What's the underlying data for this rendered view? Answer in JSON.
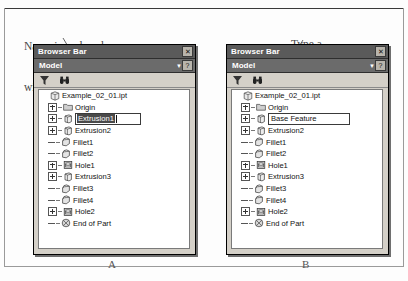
{
  "figure": {
    "labels": {
      "left": "A",
      "right": "B"
    },
    "annotations": {
      "left_line1": "Name is replaced",
      "left_line2": "with a text box",
      "right_line1": "Type a",
      "right_line2": "new name"
    }
  },
  "panel_left": {
    "titlebar": {
      "title": "Browser Bar",
      "close_label": "✕"
    },
    "modelbar": {
      "label": "Model",
      "caret": "▼",
      "help_label": "?"
    },
    "toolbar": {
      "filter_icon": "funnel-icon",
      "find_icon": "binoculars-icon"
    },
    "tree": {
      "root": {
        "label": "Example_02_01.ipt",
        "icon": "part-document-icon"
      },
      "items": [
        {
          "label": "Origin",
          "icon": "folder-icon",
          "expander": "plus"
        },
        {
          "label": "Extrusion1",
          "icon": "extrusion-icon",
          "expander": "plus",
          "editing": true,
          "selected": true
        },
        {
          "label": "Extrusion2",
          "icon": "extrusion-icon",
          "expander": "plus"
        },
        {
          "label": "Fillet1",
          "icon": "fillet-icon",
          "expander": "dash"
        },
        {
          "label": "Fillet2",
          "icon": "fillet-icon",
          "expander": "dash"
        },
        {
          "label": "Hole1",
          "icon": "hole-icon",
          "expander": "plus"
        },
        {
          "label": "Extrusion3",
          "icon": "extrusion-icon",
          "expander": "plus"
        },
        {
          "label": "Fillet3",
          "icon": "fillet-icon",
          "expander": "dash"
        },
        {
          "label": "Fillet4",
          "icon": "fillet-icon",
          "expander": "dash"
        },
        {
          "label": "Hole2",
          "icon": "hole-icon",
          "expander": "plus"
        },
        {
          "label": "End of Part",
          "icon": "end-of-part-icon",
          "expander": "dash"
        }
      ]
    }
  },
  "panel_right": {
    "titlebar": {
      "title": "Browser Bar",
      "close_label": "✕"
    },
    "modelbar": {
      "label": "Model",
      "caret": "▼",
      "help_label": "?"
    },
    "toolbar": {
      "filter_icon": "funnel-icon",
      "find_icon": "binoculars-icon"
    },
    "tree": {
      "root": {
        "label": "Example_02_01.ipt",
        "icon": "part-document-icon"
      },
      "items": [
        {
          "label": "Origin",
          "icon": "folder-icon",
          "expander": "plus"
        },
        {
          "label": "Base Feature",
          "icon": "extrusion-icon",
          "expander": "plus",
          "editing": true,
          "selected": false
        },
        {
          "label": "Extrusion2",
          "icon": "extrusion-icon",
          "expander": "plus"
        },
        {
          "label": "Fillet1",
          "icon": "fillet-icon",
          "expander": "dash"
        },
        {
          "label": "Fillet2",
          "icon": "fillet-icon",
          "expander": "dash"
        },
        {
          "label": "Hole1",
          "icon": "hole-icon",
          "expander": "plus"
        },
        {
          "label": "Extrusion3",
          "icon": "extrusion-icon",
          "expander": "plus"
        },
        {
          "label": "Fillet3",
          "icon": "fillet-icon",
          "expander": "dash"
        },
        {
          "label": "Fillet4",
          "icon": "fillet-icon",
          "expander": "dash"
        },
        {
          "label": "Hole2",
          "icon": "hole-icon",
          "expander": "plus"
        },
        {
          "label": "End of Part",
          "icon": "end-of-part-icon",
          "expander": "dash"
        }
      ]
    }
  },
  "colors": {
    "titlebar": "#5a5a5a",
    "modelbar": "#6b6b6b",
    "panel_face": "#d4d0c8",
    "selection": "#4a4a4a",
    "tree_background": "#ffffff"
  }
}
